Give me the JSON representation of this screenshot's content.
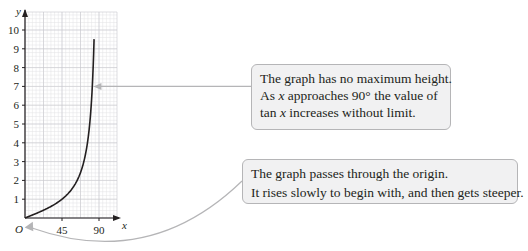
{
  "chart_data": {
    "type": "line",
    "title": "",
    "function": "y = tan x",
    "xlabel": "x",
    "ylabel": "y",
    "origin_label": "O",
    "xlim": [
      0,
      90
    ],
    "ylim": [
      0,
      10
    ],
    "x_ticks": [
      45,
      90
    ],
    "y_ticks": [
      1,
      2,
      3,
      4,
      5,
      6,
      7,
      8,
      9,
      10
    ],
    "grid": true,
    "series": [
      {
        "name": "tan x",
        "x": [
          0,
          10,
          20,
          30,
          40,
          45,
          50,
          55,
          60,
          65,
          70,
          75,
          80,
          82,
          84,
          85,
          86,
          87,
          88,
          89.5
        ],
        "values": [
          0,
          0.18,
          0.36,
          0.58,
          0.84,
          1.0,
          1.19,
          1.43,
          1.73,
          2.14,
          2.75,
          3.73,
          5.67,
          7.12,
          9.51,
          10,
          10,
          10,
          10,
          10
        ]
      }
    ],
    "annotations": [
      {
        "lines": [
          "The graph has no maximum height.",
          "As x approaches 90° the value of",
          "tan x increases without limit."
        ],
        "points_to": {
          "x": 82,
          "y": 7
        }
      },
      {
        "lines": [
          "The graph passes through the origin.",
          "It rises slowly to begin with, and then gets steeper."
        ],
        "points_to": {
          "x": 0,
          "y": 0
        }
      }
    ]
  },
  "axis": {
    "x_letter": "x",
    "y_letter": "y",
    "origin": "O",
    "x_tick_labels": [
      "45",
      "90"
    ],
    "y_tick_labels": [
      "1",
      "2",
      "3",
      "4",
      "5",
      "6",
      "7",
      "8",
      "9",
      "10"
    ]
  },
  "callouts": {
    "top": {
      "line1": "The graph has no maximum height.",
      "line2_pre": "As ",
      "line2_var": "x",
      "line2_post": " approaches 90° the value of",
      "line3_pre": "tan ",
      "line3_var": "x",
      "line3_post": " increases without limit."
    },
    "bottom": {
      "line1": "The graph passes through the origin.",
      "line2": "It rises slowly to begin with, and then gets steeper."
    }
  },
  "colors": {
    "grid_minor": "#e3e3e5",
    "grid_major": "#c8c8cc",
    "curve": "#231f20",
    "arrow": "#b5b5b7",
    "callout_bg": "#f1f1f2"
  }
}
